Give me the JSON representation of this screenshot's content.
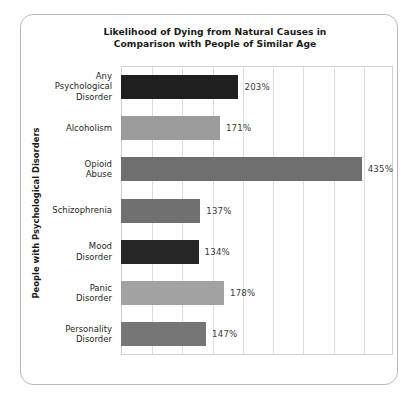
{
  "chart_data": {
    "type": "bar",
    "orientation": "horizontal",
    "title": "Likelihood of Dying from Natural Causes in Comparison with People of Similar Age",
    "title_lines": [
      "Likelihood of Dying from Natural Causes in",
      "Comparison with People of Similar Age"
    ],
    "ylabel": "People with Psychological Disorders",
    "xlabel": "",
    "categories": [
      "Any Psychological Disorder",
      "Alcoholism",
      "Opioid Abuse",
      "Schizophrenia",
      "Mood Disorder",
      "Panic Disorder",
      "Personality Disorder"
    ],
    "category_lines": [
      [
        "Any",
        "Psychological",
        "Disorder"
      ],
      [
        "Alcoholism"
      ],
      [
        "Opioid",
        "Abuse"
      ],
      [
        "Schizophrenia"
      ],
      [
        "Mood",
        "Disorder"
      ],
      [
        "Panic",
        "Disorder"
      ],
      [
        "Personality",
        "Disorder"
      ]
    ],
    "values": [
      203,
      171,
      435,
      137,
      134,
      178,
      147
    ],
    "value_labels": [
      "203%",
      "171%",
      "435%",
      "137%",
      "134%",
      "178%",
      "147%"
    ],
    "bar_colors": [
      "#1f1f1f",
      "#9b9b9b",
      "#6f6f6f",
      "#707070",
      "#262626",
      "#a2a2a2",
      "#767676"
    ],
    "xlim": [
      0,
      470
    ],
    "gridlines": true,
    "gridline_count": 9,
    "grid_color": "#dcdcdc",
    "legend": "none",
    "axis_border_color": "#d2d2d2",
    "frame_border_color": "#b9b9b9",
    "text_color": "#1c1c1c"
  }
}
